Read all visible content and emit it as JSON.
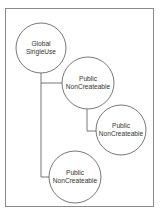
{
  "diagram": {
    "title": "",
    "frame": {
      "x": 5,
      "y": 8,
      "width": 148,
      "height": 198,
      "stroke": "#8a8a8a"
    },
    "line_color": "#555555",
    "nodes": [
      {
        "id": "global-singleuse",
        "line1": "Global",
        "line2": "SingleUse",
        "cx": 41,
        "cy": 48,
        "r": 25
      },
      {
        "id": "public-noncreateable-1",
        "line1": "Public",
        "line2": "NonCreateable",
        "cx": 88,
        "cy": 83,
        "r": 26
      },
      {
        "id": "public-noncreateable-2",
        "line1": "Public",
        "line2": "NonCreateable",
        "cx": 121,
        "cy": 130,
        "r": 25
      },
      {
        "id": "public-noncreateable-3",
        "line1": "Public",
        "line2": "NonCreateable",
        "cx": 75,
        "cy": 177,
        "r": 26
      }
    ],
    "edges": [
      {
        "from": "global-singleuse",
        "to": "public-noncreateable-1"
      },
      {
        "from": "public-noncreateable-1",
        "to": "public-noncreateable-2"
      },
      {
        "from": "global-singleuse",
        "to": "public-noncreateable-3"
      }
    ]
  }
}
